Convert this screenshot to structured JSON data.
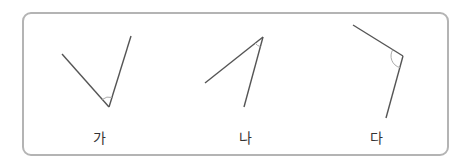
{
  "figures": [
    {
      "label": "가",
      "label_pos": [
        99,
        127
      ],
      "vertex": [
        109,
        107
      ],
      "ray1": [
        62,
        54
      ],
      "ray2": [
        131,
        36
      ],
      "arc_r": 10
    },
    {
      "label": "나",
      "label_pos": [
        245,
        127
      ],
      "vertex": [
        263,
        37
      ],
      "ray1": [
        205,
        83
      ],
      "ray2": [
        244,
        107
      ],
      "arc_r": 10
    },
    {
      "label": "다",
      "label_pos": [
        376,
        127
      ],
      "vertex": [
        403,
        56
      ],
      "ray1": [
        353,
        25
      ],
      "ray2": [
        386,
        118
      ],
      "arc_r": 12
    }
  ],
  "colors": {
    "line": "#555555",
    "arc": "#aaaaaa",
    "border": "#b4b4b4"
  }
}
